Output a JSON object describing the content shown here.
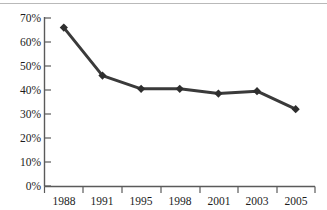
{
  "chart_data": {
    "type": "line",
    "title": "",
    "subtitle": "",
    "xlabel": "",
    "ylabel": "",
    "categories": [
      "1988",
      "1991",
      "1995",
      "1998",
      "2001",
      "2003",
      "2005"
    ],
    "values": [
      66,
      46,
      40.5,
      40.5,
      38.5,
      39.5,
      32
    ],
    "series": [
      {
        "name": "",
        "values": [
          66,
          46,
          40.5,
          40.5,
          38.5,
          39.5,
          32
        ]
      }
    ],
    "ylim": [
      0,
      70
    ],
    "ytick_values": [
      0,
      10,
      20,
      30,
      40,
      50,
      60,
      70
    ],
    "ytick_labels": [
      "0%",
      "10%",
      "20%",
      "30%",
      "40%",
      "50%",
      "60%",
      "70%"
    ],
    "xtick_labels": [
      "1988",
      "1991",
      "1995",
      "1998",
      "2001",
      "2003",
      "2005"
    ],
    "grid": false,
    "legend": false,
    "legend_position": "none",
    "marker": "diamond",
    "line_color": "#3a3a3a",
    "marker_color": "#2e2e2e",
    "axis_color": "#5a5a5a",
    "text_color": "#1c1c1c",
    "background_color": "#ffffff",
    "annotations": []
  }
}
